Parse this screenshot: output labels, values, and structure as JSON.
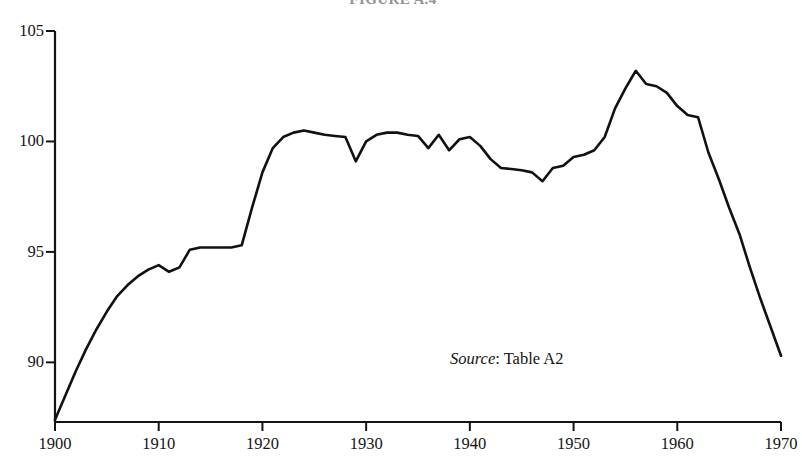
{
  "figure": {
    "title": "FIGURE A.4",
    "source_prefix": "Source",
    "source_sep": ": ",
    "source_text": "Table A2"
  },
  "axes": {
    "y_ticks": [
      {
        "value": 105,
        "label": "105"
      },
      {
        "value": 100,
        "label": "100"
      },
      {
        "value": 95,
        "label": "95"
      },
      {
        "value": 90,
        "label": "90"
      }
    ],
    "x_ticks": [
      {
        "value": 1900,
        "label": "1900"
      },
      {
        "value": 1910,
        "label": "1910"
      },
      {
        "value": 1920,
        "label": "1920"
      },
      {
        "value": 1930,
        "label": "1930"
      },
      {
        "value": 1940,
        "label": "1940"
      },
      {
        "value": 1950,
        "label": "1950"
      },
      {
        "value": 1960,
        "label": "1960"
      },
      {
        "value": 1970,
        "label": "1970"
      }
    ]
  },
  "chart_data": {
    "type": "line",
    "title": "FIGURE A.4",
    "xlabel": "",
    "ylabel": "",
    "xlim": [
      1900,
      1970
    ],
    "ylim": [
      87.3,
      105
    ],
    "grid": false,
    "legend": null,
    "annotations": [
      {
        "text": "Source: Table A2",
        "x": 1941,
        "y": 90.4
      }
    ],
    "line_color": "#111111",
    "line_width": 2.6,
    "series": [
      {
        "name": "index",
        "x": [
          1900,
          1901,
          1902,
          1903,
          1904,
          1905,
          1906,
          1907,
          1908,
          1909,
          1910,
          1911,
          1912,
          1913,
          1914,
          1915,
          1916,
          1917,
          1918,
          1919,
          1920,
          1921,
          1922,
          1923,
          1924,
          1925,
          1926,
          1927,
          1928,
          1929,
          1930,
          1931,
          1932,
          1933,
          1934,
          1935,
          1936,
          1937,
          1938,
          1939,
          1940,
          1941,
          1942,
          1943,
          1944,
          1945,
          1946,
          1947,
          1948,
          1949,
          1950,
          1951,
          1952,
          1953,
          1954,
          1955,
          1956,
          1957,
          1958,
          1959,
          1960,
          1961,
          1962,
          1963,
          1964,
          1965,
          1966,
          1967,
          1968,
          1969,
          1970
        ],
        "y": [
          87.4,
          88.5,
          89.6,
          90.6,
          91.5,
          92.3,
          93.0,
          93.5,
          93.9,
          94.2,
          94.4,
          94.1,
          94.3,
          95.1,
          95.2,
          95.2,
          95.2,
          95.2,
          95.3,
          97.0,
          98.6,
          99.7,
          100.2,
          100.4,
          100.5,
          100.4,
          100.3,
          100.25,
          100.2,
          99.1,
          100.0,
          100.3,
          100.4,
          100.4,
          100.3,
          100.25,
          99.7,
          100.3,
          99.6,
          100.1,
          100.2,
          99.8,
          99.2,
          98.8,
          98.75,
          98.7,
          98.6,
          98.2,
          98.8,
          98.9,
          99.3,
          99.4,
          99.6,
          100.2,
          101.5,
          102.4,
          103.2,
          102.6,
          102.5,
          102.2,
          101.6,
          101.2,
          101.1,
          99.5,
          98.3,
          97.0,
          95.8,
          94.3,
          92.9,
          91.6,
          90.3
        ]
      }
    ]
  }
}
